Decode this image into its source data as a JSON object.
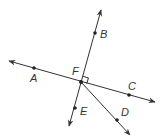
{
  "diagram": {
    "type": "geometry-lines-rays",
    "colors": {
      "stroke": "#333333",
      "point": "#222222",
      "background": "#ffffff"
    },
    "points": {
      "A": {
        "label": "A",
        "x": 34,
        "y": 68,
        "lx": 30,
        "ly": 82
      },
      "B": {
        "label": "B",
        "x": 95,
        "y": 33,
        "lx": 100,
        "ly": 38
      },
      "C": {
        "label": "C",
        "x": 129,
        "y": 95,
        "lx": 128,
        "ly": 90
      },
      "D": {
        "label": "D",
        "x": 117,
        "y": 120,
        "lx": 121,
        "ly": 116
      },
      "E": {
        "label": "E",
        "x": 75,
        "y": 108,
        "lx": 80,
        "ly": 115
      },
      "F": {
        "label": "F",
        "x": 81,
        "y": 82,
        "lx": 72,
        "ly": 75
      }
    },
    "lines": [
      {
        "name": "line-AC",
        "through": [
          "A",
          "F",
          "C"
        ],
        "x1": 9,
        "y1": 61,
        "x2": 155,
        "y2": 102,
        "arrows": "both"
      },
      {
        "name": "line-BE",
        "through": [
          "B",
          "F",
          "E"
        ],
        "x1": 101,
        "y1": 10,
        "x2": 69,
        "y2": 126,
        "arrows": "both"
      }
    ],
    "rays": [
      {
        "name": "ray-FD",
        "from": "F",
        "through": "D",
        "x1": 81,
        "y1": 82,
        "x2": 130,
        "y2": 135
      }
    ],
    "right_angle": {
      "at": "F",
      "between": [
        "FB",
        "FC"
      ]
    }
  }
}
